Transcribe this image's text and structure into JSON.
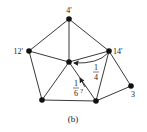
{
  "caption": "(b)",
  "colors": {
    "stroke": "#222222",
    "node": "#111111",
    "background": "#ffffff"
  },
  "nodes": [
    {
      "id": "top",
      "x": 69,
      "y": 19,
      "label": "4",
      "mark": "'"
    },
    {
      "id": "left",
      "x": 29,
      "y": 51,
      "label": "12",
      "mark": "'"
    },
    {
      "id": "center",
      "x": 69,
      "y": 62,
      "label": "",
      "mark": ""
    },
    {
      "id": "right",
      "x": 109,
      "y": 51,
      "label": "14",
      "mark": "'"
    },
    {
      "id": "bl",
      "x": 42,
      "y": 100,
      "label": "",
      "mark": ""
    },
    {
      "id": "br",
      "x": 96,
      "y": 101,
      "label": "",
      "mark": ""
    },
    {
      "id": "far",
      "x": 131,
      "y": 86,
      "label": "3",
      "mark": ""
    }
  ],
  "edges": [
    [
      "top",
      "left"
    ],
    [
      "top",
      "center"
    ],
    [
      "top",
      "right"
    ],
    [
      "left",
      "center"
    ],
    [
      "left",
      "bl"
    ],
    [
      "center",
      "right"
    ],
    [
      "center",
      "bl"
    ],
    [
      "center",
      "br"
    ],
    [
      "right",
      "br"
    ],
    [
      "right",
      "far"
    ],
    [
      "bl",
      "br"
    ],
    [
      "br",
      "far"
    ]
  ],
  "annotations": {
    "quarter": {
      "num": "1",
      "den": "4",
      "note": ""
    },
    "sixth": {
      "num": "1",
      "den": "6",
      "note": "?"
    }
  }
}
